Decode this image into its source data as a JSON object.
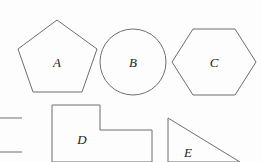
{
  "page": {
    "background_color": "#fdfdfd",
    "stroke_color": "#6e6e6e",
    "label_color": "#1a1a1a",
    "cropped_top_text": "",
    "width": 261,
    "height": 162
  },
  "figure": {
    "caption": "",
    "shapes": [
      {
        "id": "shape-a",
        "label": "A",
        "kind": "pentagon",
        "label_x": 57,
        "label_y": 62,
        "points": "57,20 97,49 82,92 33,92 18,49"
      },
      {
        "id": "shape-b",
        "label": "B",
        "kind": "circle",
        "label_x": 133,
        "label_y": 62,
        "cx": 133,
        "cy": 62,
        "r": 33
      },
      {
        "id": "shape-c",
        "label": "C",
        "kind": "hexagon",
        "label_x": 214,
        "label_y": 62,
        "points": "193,29 235,29 256,62 235,95 193,95 172,62"
      },
      {
        "id": "shape-d",
        "label": "D",
        "kind": "stepped-polygon",
        "label_x": 82,
        "label_y": 139,
        "points": "52,105 100,105 100,130 152,130 152,162 52,162"
      },
      {
        "id": "shape-e",
        "label": "E",
        "kind": "right-triangle",
        "label_x": 188,
        "label_y": 152,
        "points": "168,118 168,162 240,162"
      }
    ],
    "partial_marks": [
      {
        "id": "mark-left-upper",
        "kind": "line-segment",
        "x1": 0,
        "y1": 118,
        "x2": 22,
        "y2": 118
      },
      {
        "id": "mark-left-lower",
        "kind": "line-segment",
        "x1": 0,
        "y1": 152,
        "x2": 22,
        "y2": 152
      }
    ]
  }
}
